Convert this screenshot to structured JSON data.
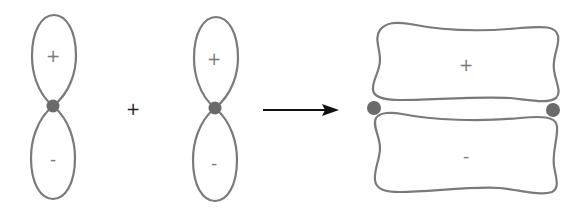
{
  "diagram": {
    "colors": {
      "lobe_stroke": "#7a7a7a",
      "nucleus": "#6a6a6a",
      "arrow": "#111111",
      "operator": "#222222"
    },
    "orbital_1": {
      "top_lobe_sign": "+",
      "bottom_lobe_sign": "-"
    },
    "operator": "+",
    "orbital_2": {
      "top_lobe_sign": "+",
      "bottom_lobe_sign": "-"
    },
    "arrow": "right-arrow",
    "pi_bond": {
      "top_lobe_sign": "+",
      "bottom_lobe_sign": "-"
    }
  }
}
